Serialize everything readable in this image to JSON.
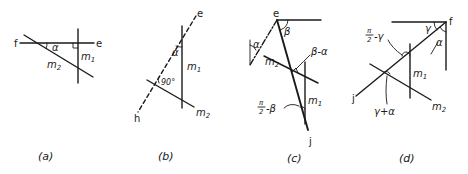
{
  "figure": {
    "panels": [
      {
        "id": "a",
        "caption": "(a)",
        "points": {
          "f": "f",
          "e": "e"
        },
        "angles": {
          "alpha": "α"
        },
        "lines": {
          "m1": "m",
          "m1_sub": "1",
          "m2": "m",
          "m2_sub": "2"
        },
        "marks": [
          "right-angle"
        ]
      },
      {
        "id": "b",
        "caption": "(b)",
        "points": {
          "e": "e",
          "h": "h"
        },
        "angles": {
          "alpha": "α",
          "right": "90°"
        },
        "lines": {
          "m1": "m",
          "m1_sub": "1",
          "m2": "m",
          "m2_sub": "2"
        }
      },
      {
        "id": "c",
        "caption": "(c)",
        "points": {
          "e": "e",
          "j": "j"
        },
        "angles": {
          "alpha": "α",
          "beta": "β",
          "beta_minus_alpha": "β-α",
          "half_pi_minus_beta": "-β",
          "pi": "π",
          "two": "2"
        },
        "lines": {
          "m1": "m",
          "m1_sub": "1",
          "m2": "m",
          "m2_sub": "2"
        }
      },
      {
        "id": "d",
        "caption": "(d)",
        "points": {
          "f": "f",
          "j": "j"
        },
        "angles": {
          "gamma": "γ",
          "alpha": "α",
          "half_pi_minus_gamma": "-γ",
          "pi": "π",
          "two": "2",
          "gamma_plus_alpha": "γ+α"
        },
        "lines": {
          "m1": "m",
          "m1_sub": "1",
          "m2": "m",
          "m2_sub": "2"
        }
      }
    ]
  }
}
